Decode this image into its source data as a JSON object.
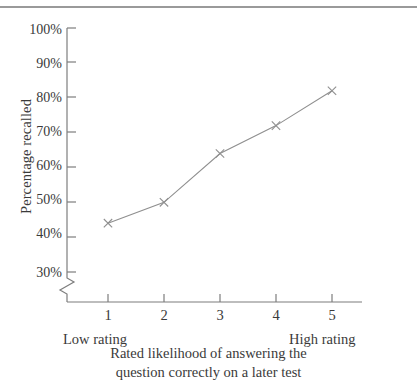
{
  "figure": {
    "caption_line1": "Rated likelihood of answering the",
    "caption_line2": "question correctly on a later test",
    "low_anchor": "Low rating",
    "high_anchor": "High rating",
    "y_axis_title": "Percentage recalled"
  },
  "chart_data": {
    "type": "line",
    "title": "",
    "xlabel": "Rated likelihood of answering the question correctly on a later test",
    "ylabel": "Percentage recalled",
    "categories": [
      "1",
      "2",
      "3",
      "4",
      "5"
    ],
    "x": [
      1,
      2,
      3,
      4,
      5
    ],
    "values": [
      44,
      50,
      64,
      72,
      82
    ],
    "ytick_labels": [
      "100%",
      "90%",
      "80%",
      "70%",
      "60%",
      "50%",
      "40%",
      "30%"
    ],
    "ytick_values": [
      100,
      90,
      80,
      70,
      60,
      50,
      40,
      30
    ],
    "xtick_labels": [
      "1",
      "2",
      "3",
      "4",
      "5"
    ],
    "ylim": [
      30,
      100
    ],
    "xlim": [
      0.45,
      5.55
    ],
    "axis_break": true,
    "axis_break_note": "y-axis broken below 30%",
    "grid": false,
    "legend": null,
    "marker": "x",
    "line_color": "#8f8f8f",
    "marker_color": "#8f8f8f",
    "axis_color": "#7d7d7d",
    "x_anchor_low": "Low rating",
    "x_anchor_high": "High rating"
  }
}
